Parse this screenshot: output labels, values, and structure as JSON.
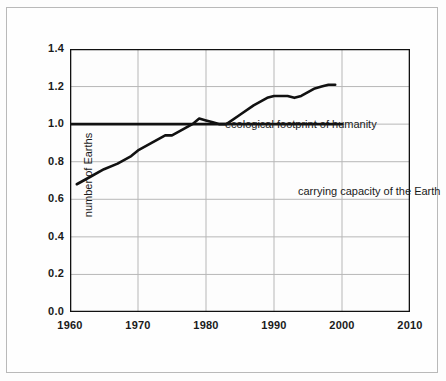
{
  "chart_data": {
    "type": "line",
    "title": "",
    "xlabel": "",
    "ylabel": "number of Earths",
    "xlim": [
      1960,
      2010
    ],
    "ylim": [
      0.0,
      1.4
    ],
    "grid": true,
    "legend_position": "inline-annotations",
    "x_ticks": [
      "1960",
      "1970",
      "1980",
      "1990",
      "2000",
      "2010"
    ],
    "y_ticks": [
      "0.0",
      "0.2",
      "0.4",
      "0.6",
      "0.8",
      "1.0",
      "1.2",
      "1.4"
    ],
    "x_tick_values": [
      1960,
      1970,
      1980,
      1990,
      2000,
      2010
    ],
    "y_tick_values": [
      0.0,
      0.2,
      0.4,
      0.6,
      0.8,
      1.0,
      1.2,
      1.4
    ],
    "annotations": [
      {
        "text": "ecological footprint of humanity",
        "x": 1973,
        "y": 1.27
      },
      {
        "text": "carrying capacity of the Earth",
        "x": 1984,
        "y": 0.92
      }
    ],
    "series": [
      {
        "name": "ecological footprint of humanity",
        "color": "#111111",
        "x": [
          1961,
          1963,
          1965,
          1967,
          1969,
          1970,
          1972,
          1974,
          1975,
          1976,
          1977,
          1978,
          1979,
          1980,
          1981,
          1982,
          1983,
          1985,
          1987,
          1989,
          1990,
          1991,
          1992,
          1993,
          1994,
          1995,
          1996,
          1997,
          1998,
          1999
        ],
        "values": [
          0.68,
          0.72,
          0.76,
          0.79,
          0.83,
          0.86,
          0.9,
          0.94,
          0.94,
          0.96,
          0.98,
          1.0,
          1.03,
          1.02,
          1.01,
          1.0,
          1.0,
          1.05,
          1.1,
          1.14,
          1.15,
          1.15,
          1.15,
          1.14,
          1.15,
          1.17,
          1.19,
          1.2,
          1.21,
          1.21
        ]
      },
      {
        "name": "carrying capacity of the Earth",
        "color": "#111111",
        "x": [
          1960,
          2000
        ],
        "values": [
          1.0,
          1.0
        ]
      }
    ]
  },
  "axes": {
    "y_title": "number of Earths"
  },
  "annotations": {
    "footprint": "ecological footprint of humanity",
    "capacity": "carrying capacity of the Earth"
  },
  "colors": {
    "line": "#111111",
    "grid": "#b7b7b7",
    "axis": "#111111",
    "frame": "#b9b9b9",
    "background": "#fdfdfd",
    "text": "#1a1a1a"
  }
}
